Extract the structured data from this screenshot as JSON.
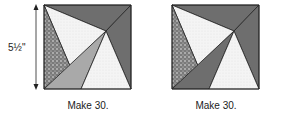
{
  "dimension_label": "5½\"",
  "blocks": [
    {
      "caption": "Make 30.",
      "variant": "light-bottom-left"
    },
    {
      "caption": "Make 30.",
      "variant": "dark-bottom-left"
    }
  ],
  "colors": {
    "dark": "#6e6e6e",
    "medium": "#a9a9a9",
    "light": "#f2f2f2",
    "outline": "#222222"
  }
}
